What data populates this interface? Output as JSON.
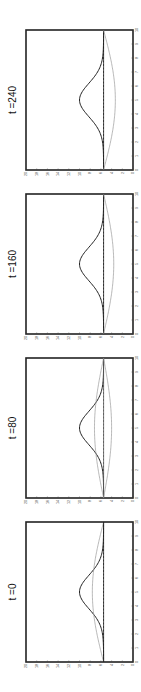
{
  "chart_data": [
    {
      "type": "line",
      "title": "t =240",
      "xlabel": "",
      "ylabel": "",
      "xlim": [
        0,
        10
      ],
      "ylim": [
        0,
        20
      ],
      "xticks": [
        0,
        1,
        2,
        3,
        4,
        5,
        6,
        7,
        8,
        9,
        10
      ],
      "yticks": [
        0,
        2,
        4,
        6,
        8,
        10,
        12,
        14,
        16,
        18,
        20
      ],
      "grid": false,
      "rotation": "figure rotated 90 degrees counter-clockwise",
      "series": [
        {
          "name": "bell",
          "style": "dark",
          "peak": 10.0,
          "base": 5.5
        },
        {
          "name": "flat",
          "style": "dark",
          "peak": 5.5,
          "base": 5.5
        },
        {
          "name": "lower",
          "style": "light",
          "peak": 3.3,
          "base": 5.5
        }
      ]
    },
    {
      "type": "line",
      "title": "t =160",
      "xlabel": "",
      "ylabel": "",
      "xlim": [
        0,
        10
      ],
      "ylim": [
        0,
        20
      ],
      "xticks": [
        0,
        1,
        2,
        3,
        4,
        5,
        6,
        7,
        8,
        9,
        10
      ],
      "yticks": [
        0,
        2,
        4,
        6,
        8,
        10,
        12,
        14,
        16,
        18,
        20
      ],
      "grid": false,
      "series": [
        {
          "name": "bell",
          "style": "dark",
          "peak": 10.0,
          "base": 5.5
        },
        {
          "name": "flat",
          "style": "dark",
          "peak": 5.5,
          "base": 5.5
        },
        {
          "name": "lower",
          "style": "light",
          "peak": 3.6,
          "base": 5.5
        }
      ]
    },
    {
      "type": "line",
      "title": "t =80",
      "xlabel": "",
      "ylabel": "",
      "xlim": [
        0,
        10
      ],
      "ylim": [
        0,
        20
      ],
      "xticks": [
        0,
        1,
        2,
        3,
        4,
        5,
        6,
        7,
        8,
        9,
        10
      ],
      "yticks": [
        0,
        2,
        4,
        6,
        8,
        10,
        12,
        14,
        16,
        18,
        20
      ],
      "grid": false,
      "series": [
        {
          "name": "bell",
          "style": "dark",
          "peak": 10.0,
          "base": 5.5
        },
        {
          "name": "upper",
          "style": "light",
          "peak": 7.2,
          "base": 5.5
        },
        {
          "name": "flat",
          "style": "mid",
          "peak": 5.5,
          "base": 5.5
        },
        {
          "name": "lower",
          "style": "light",
          "peak": 4.0,
          "base": 5.5
        }
      ]
    },
    {
      "type": "line",
      "title": "t =0",
      "xlabel": "",
      "ylabel": "",
      "xlim": [
        0,
        10
      ],
      "ylim": [
        0,
        20
      ],
      "xticks": [
        0,
        1,
        2,
        3,
        4,
        5,
        6,
        7,
        8,
        9,
        10
      ],
      "yticks": [
        0,
        2,
        4,
        6,
        8,
        10,
        12,
        14,
        16,
        18,
        20
      ],
      "grid": false,
      "series": [
        {
          "name": "bell",
          "style": "dark",
          "peak": 10.0,
          "base": 5.5
        },
        {
          "name": "upper",
          "style": "light",
          "peak": 7.6,
          "base": 5.5
        },
        {
          "name": "flat",
          "style": "dark",
          "peak": 5.5,
          "base": 5.5
        }
      ]
    }
  ],
  "panels": [
    {
      "title": "t =240",
      "center": [
        71,
        100
      ]
    },
    {
      "title": "t =160",
      "center": [
        71,
        264
      ]
    },
    {
      "title": "t =80",
      "center": [
        71,
        428
      ]
    },
    {
      "title": "t =0",
      "center": [
        71,
        592
      ]
    }
  ],
  "colors": {
    "dark": "#222222",
    "mid": "#555555",
    "light": "#9a9a9a"
  }
}
